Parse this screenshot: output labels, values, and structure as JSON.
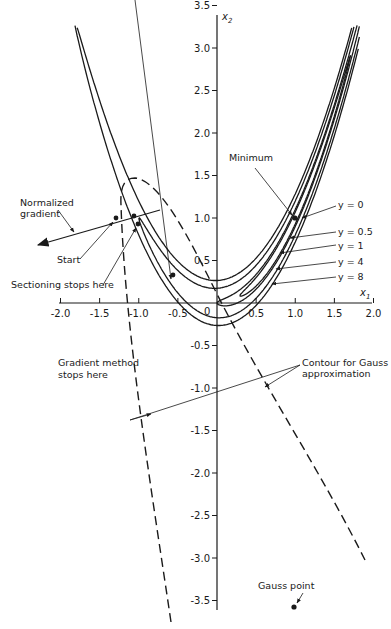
{
  "chart_data": {
    "type": "line",
    "title": "",
    "xlabel": "x1",
    "ylabel": "x2",
    "xlim": [
      -2.0,
      2.0
    ],
    "ylim": [
      -3.5,
      3.5
    ],
    "grid": false,
    "function": "y = 100(x2 - x1^2)^2 + (1 - x1)^2",
    "x_ticks": [
      "-2.0",
      "-1.5",
      "-1.0",
      "-0.5",
      "0.5",
      "1.0",
      "1.5",
      "2.0"
    ],
    "y_ticks": [
      "3.5",
      "3.0",
      "2.5",
      "2.0",
      "1.5",
      "1.0",
      "0.5",
      "-0.5",
      "-1.0",
      "-1.5",
      "-2.0",
      "-2.5",
      "-3.0",
      "-3.5"
    ],
    "origin_label": "0",
    "contour_levels": [
      0,
      0.5,
      1,
      4,
      8
    ],
    "contour_labels": [
      "y = 0",
      "y = 0.5",
      "y = 1",
      "y = 4",
      "y = 8"
    ],
    "points": [
      {
        "name": "Minimum",
        "x1": 1.0,
        "x2": 1.0
      },
      {
        "name": "Start",
        "x1": -1.2,
        "x2": 1.0
      },
      {
        "name": "Sectioning stops here",
        "x1": -1.0,
        "x2": 1.05
      },
      {
        "name": "Gradient method stops here",
        "x1": -0.5,
        "x2": 0.3
      },
      {
        "name": "Gauss point",
        "x1": 0.85,
        "x2": -3.95
      }
    ],
    "gauss_contour": {
      "style": "dashed",
      "description": "Contour for Gauss approximation (parabola-like dashed curve with apex near x1 = -1.05, x2 = 1.5)"
    },
    "normalized_gradient": {
      "from": [
        -0.75,
        1.1
      ],
      "to": [
        -2.2,
        0.68
      ]
    },
    "annotations": [
      "Normalized gradient",
      "Start",
      "Sectioning stops here",
      "Gradient method stops here",
      "Minimum",
      "Contour for Gauss approximation",
      "Gauss point"
    ]
  },
  "labels": {
    "x_axis": "x",
    "x_axis_sub": "1",
    "y_axis": "x",
    "y_axis_sub": "2",
    "origin": "0",
    "normalized_gradient_1": "Normalized",
    "normalized_gradient_2": "gradient",
    "start": "Start",
    "sectioning": "Sectioning stops here",
    "gradient_method_1": "Gradient method",
    "gradient_method_2": "stops here",
    "minimum": "Minimum",
    "gauss_contour_1": "Contour for Gauss",
    "gauss_contour_2": "approximation",
    "gauss_point": "Gauss point",
    "y0": "y = 0",
    "y05": "y = 0.5",
    "y1": "y = 1",
    "y4": "y = 4",
    "y8": "y = 8"
  },
  "ticks": {
    "x": [
      {
        "v": -2.0,
        "label": "-2.0"
      },
      {
        "v": -1.5,
        "label": "-1.5"
      },
      {
        "v": -1.0,
        "label": "-1.0"
      },
      {
        "v": -0.5,
        "label": "-0.5"
      },
      {
        "v": 0.5,
        "label": "0.5"
      },
      {
        "v": 1.0,
        "label": "1.0"
      },
      {
        "v": 1.5,
        "label": "1.5"
      },
      {
        "v": 2.0,
        "label": "2.0"
      }
    ],
    "y": [
      {
        "v": 3.5,
        "label": "3.5"
      },
      {
        "v": 3.0,
        "label": "3.0"
      },
      {
        "v": 2.5,
        "label": "2.5"
      },
      {
        "v": 2.0,
        "label": "2.0"
      },
      {
        "v": 1.5,
        "label": "1.5"
      },
      {
        "v": 1.0,
        "label": "1.0"
      },
      {
        "v": 0.5,
        "label": "0.5"
      },
      {
        "v": -0.5,
        "label": "-0.5"
      },
      {
        "v": -1.0,
        "label": "-1.0"
      },
      {
        "v": -1.5,
        "label": "-1.5"
      },
      {
        "v": -2.0,
        "label": "-2.0"
      },
      {
        "v": -2.5,
        "label": "-2.5"
      },
      {
        "v": -3.0,
        "label": "-3.0"
      },
      {
        "v": -3.5,
        "label": "-3.5"
      }
    ]
  },
  "colors": {
    "ink": "#1a1a1a",
    "background": "#ffffff"
  }
}
